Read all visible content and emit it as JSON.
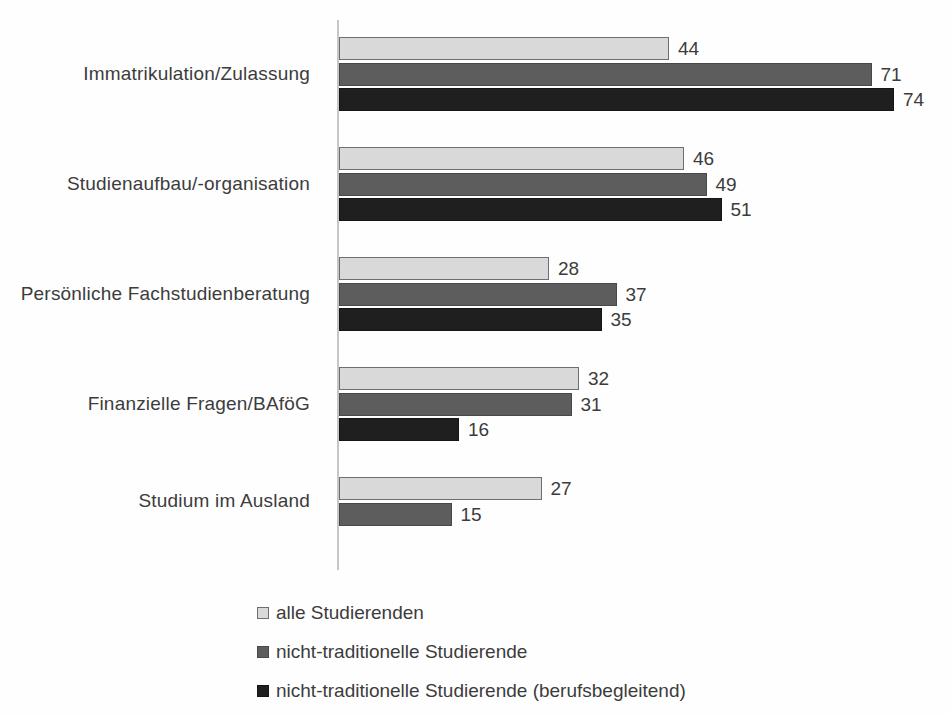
{
  "chart_data": {
    "type": "bar",
    "orientation": "horizontal",
    "title": "",
    "xlabel": "",
    "ylabel": "",
    "grid": false,
    "xlim": [
      0,
      78
    ],
    "value_labels": true,
    "legend_position": "bottom-left",
    "categories": [
      "Immatrikulation/Zulassung",
      "Studienaufbau/-organisation",
      "Persönliche Fachstudienberatung",
      "Finanzielle Fragen/BAföG",
      "Studium im Ausland"
    ],
    "series": [
      {
        "name": "alle Studierenden",
        "fill_color": "#d9d9d9",
        "border_color": "#6e6e6e",
        "values": [
          44,
          46,
          28,
          32,
          27
        ]
      },
      {
        "name": "nicht-traditionelle Studierende",
        "fill_color": "#5d5d5d",
        "border_color": "#484848",
        "values": [
          71,
          49,
          37,
          31,
          15
        ]
      },
      {
        "name": "nicht-traditionelle Studierende (berufsbegleitend)",
        "fill_color": "#1f1f1f",
        "border_color": "#151515",
        "values": [
          74,
          51,
          35,
          16,
          null
        ]
      }
    ],
    "colors": {
      "text": "#3c3c3c",
      "axis_line": "#c6c6c6",
      "background": "#fefefe"
    }
  }
}
